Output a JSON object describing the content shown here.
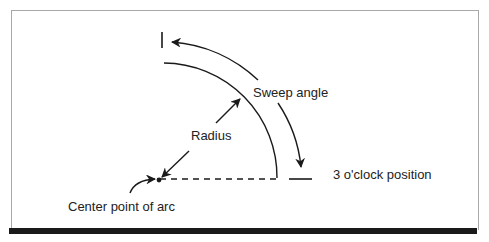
{
  "diagram": {
    "labels": {
      "sweep_angle": "Sweep angle",
      "radius": "Radius",
      "three_oclock": "3 o'clock position",
      "center_point": "Center point of arc"
    },
    "colors": {
      "ink": "#1a1a1a",
      "frame": "#a8a8a8",
      "background": "#ffffff"
    }
  }
}
